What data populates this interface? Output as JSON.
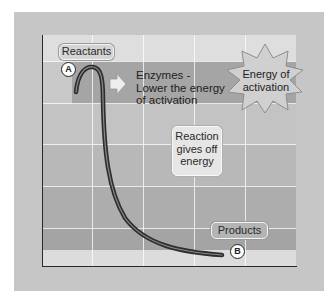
{
  "diagram": {
    "labels": {
      "reactants": "Reactants",
      "products": "Products",
      "marker_a": "A",
      "marker_b": "B",
      "enzymes_line1": "Enzymes -",
      "enzymes_line2": "Lower the energy",
      "enzymes_line3": "of activation",
      "activation_line1": "Energy of",
      "activation_line2": "activation",
      "reaction_line1": "Reaction",
      "reaction_line2": "gives off",
      "reaction_line3": "energy"
    },
    "colors": {
      "frame": "#c6c6c6",
      "plot_top": "#dcdcdc",
      "enzyme_band": "#a3a3a3",
      "plot_mid": "#bdbdbd",
      "plot_low": "#a8a8a8",
      "plot_bottom_strip": "#dedede",
      "curve": "#333333",
      "starburst": "#cfcfcf"
    },
    "icons": {
      "arrow": "right-arrow-icon",
      "starburst": "starburst-icon"
    }
  }
}
